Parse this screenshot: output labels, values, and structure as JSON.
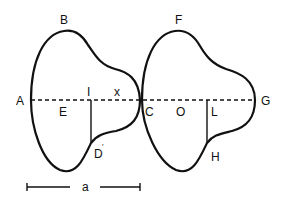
{
  "diagram": {
    "type": "geometric figure",
    "left_shape": {
      "labels": {
        "top": "B",
        "left_end": "A",
        "center": "E",
        "segment_top": "I",
        "segment_bottom": "D",
        "gap": "x",
        "touch_point": "C"
      }
    },
    "right_shape": {
      "labels": {
        "top": "F",
        "right_end": "G",
        "center": "O",
        "segment_top": "L",
        "segment_bottom": "H"
      }
    },
    "scale_bar": {
      "label": "a"
    },
    "colors": {
      "ink": "#111111",
      "background": "#ffffff"
    }
  }
}
